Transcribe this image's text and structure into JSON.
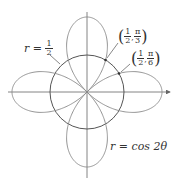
{
  "diagram": {
    "labels": {
      "circle_eq_lhs": "r =",
      "circle_num": "1",
      "circle_den": "2",
      "rose_eq": "r = cos 2θ",
      "point1": {
        "r_num": "1",
        "r_den": "2",
        "theta_num": "π",
        "theta_den": "3"
      },
      "point2": {
        "r_num": "1",
        "r_den": "2",
        "theta_num": "π",
        "theta_den": "6"
      }
    },
    "colors": {
      "curve": "#777777",
      "circle": "#555555",
      "axis": "#666666",
      "text": "#333333"
    }
  }
}
